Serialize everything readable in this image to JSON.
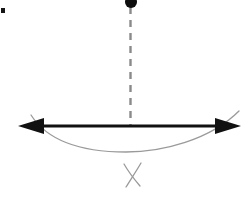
{
  "figure": {
    "title": "Pendulum bob suspended above a horizontal axis with swing arc",
    "background_color": "#ffffff",
    "width": 250,
    "height": 197
  },
  "colors": {
    "axis_line": "#111111",
    "arrowhead": "#111111",
    "dashed_string": "#8a8a8a",
    "arc_curve": "#9a9a9a",
    "cross_mark": "#9a9a9a",
    "bob_fill": "#0d0d0d",
    "corner_mark": "#151515"
  },
  "elements": {
    "bob": {
      "name": "pendulum-bob",
      "shape": "filled-circle-clipped-top",
      "center_x": 131,
      "center_y": 2,
      "radius": 6
    },
    "string": {
      "name": "dashed-string",
      "x": 130.5,
      "y_top": 7,
      "y_bottom": 125,
      "dash_pattern": "7 6",
      "stroke_width": 2.4
    },
    "axis": {
      "name": "horizontal-double-arrow",
      "y": 126,
      "x_start": 18,
      "x_end": 241,
      "stroke_width": 3.2,
      "arrowhead_left": {
        "tip_x": 18,
        "back_x": 44,
        "half_height": 8
      },
      "arrowhead_right": {
        "tip_x": 241,
        "back_x": 215,
        "half_height": 8
      }
    },
    "arc": {
      "name": "swing-arc",
      "start_x": 31,
      "start_y": 115,
      "end_x": 239,
      "end_y": 111,
      "lowest_x": 126,
      "lowest_y": 152,
      "stroke_width": 1.3
    },
    "cross": {
      "name": "cross-mark",
      "center_x": 132,
      "center_y": 175,
      "stroke_width": 1.3,
      "stroke1": {
        "x1": 124,
        "y1": 164,
        "x2": 140,
        "y2": 186
      },
      "stroke2": {
        "x1": 141,
        "y1": 163,
        "x2": 126,
        "y2": 187
      }
    },
    "corner_artifact": {
      "name": "corner-speck",
      "x": 1,
      "y": 8,
      "width": 4,
      "height": 5
    }
  },
  "labels": {
    "bob": "pendulum bob",
    "string": "dashed vertical string",
    "axis": "horizontal double-headed arrow",
    "arc": "swing arc below axis",
    "cross": "crossed tick mark"
  }
}
